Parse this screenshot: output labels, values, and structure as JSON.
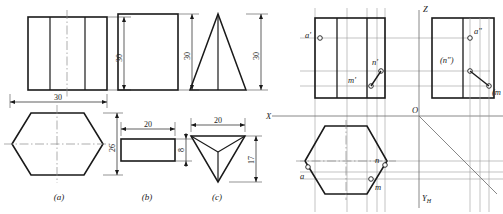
{
  "figure": {
    "left_panel": {
      "name": "three-view-solids",
      "items": [
        {
          "caption": "(a)",
          "solid": "hexagonal prism",
          "front_view": {
            "shape": "rectangle-with-vertical-edges",
            "height_dim": "30",
            "width_dim": "30"
          },
          "top_view": {
            "shape": "hexagon",
            "width_dim": "30",
            "depth_dim": "26"
          }
        },
        {
          "caption": "(b)",
          "solid": "rectangular block",
          "front_view": {
            "shape": "rectangle",
            "height_dim": "30"
          },
          "top_view": {
            "shape": "rectangle",
            "width_dim": "20",
            "depth_dim": "8"
          }
        },
        {
          "caption": "(c)",
          "solid": "triangular pyramid",
          "front_view": {
            "shape": "triangle",
            "height_dim": "30"
          },
          "top_view": {
            "shape": "inverted-triangle-with-center-lines",
            "width_dim": "20",
            "depth_dim": "17"
          }
        }
      ]
    },
    "right_panel": {
      "name": "projection-diagram",
      "axes": {
        "z": "Z",
        "x": "X",
        "origin": "O",
        "y_h": "Y",
        "y_h_sub": "H"
      },
      "front_view_points": [
        {
          "label": "a'",
          "visible": true
        },
        {
          "label": "n'",
          "visible": true
        },
        {
          "label": "m'",
          "visible": true
        }
      ],
      "side_view_points": [
        {
          "label": "a\"",
          "visible": true
        },
        {
          "label": "(n\")",
          "visible": false
        },
        {
          "label": "(m\")",
          "visible": false,
          "clipped": true,
          "clipped_text": "(m"
        }
      ],
      "top_view_points": [
        {
          "label": "a",
          "visible": true
        },
        {
          "label": "n",
          "visible": true
        },
        {
          "label": "m",
          "visible": true
        }
      ],
      "miter_line": "45-degree"
    },
    "colors": {
      "outline": "#1a1a1a",
      "thin": "#8a8a8a",
      "projection": "#9a9a9a",
      "background": "#ffffff"
    }
  }
}
